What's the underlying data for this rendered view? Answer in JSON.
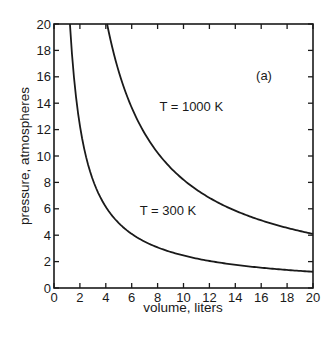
{
  "chart_data": {
    "type": "line",
    "title": "",
    "panel_label": "(a)",
    "xlabel": "volume, liters",
    "ylabel": "pressure, atmospheres",
    "xlim": [
      0,
      20
    ],
    "ylim": [
      0,
      20
    ],
    "xticks": [
      0,
      2,
      4,
      6,
      8,
      10,
      12,
      14,
      16,
      18,
      20
    ],
    "yticks": [
      0,
      2,
      4,
      6,
      8,
      10,
      12,
      14,
      16,
      18,
      20
    ],
    "grid": false,
    "legend": null,
    "series": [
      {
        "name": "T = 300 K",
        "label_pos": [
          8.8,
          5.5
        ],
        "x": [
          1.23,
          1.5,
          2,
          2.5,
          3,
          4,
          5,
          6,
          7,
          8,
          10,
          12,
          14,
          16,
          18,
          20
        ],
        "y": [
          20,
          16.4,
          12.3,
          9.85,
          8.2,
          6.15,
          4.9,
          4.1,
          3.5,
          3.1,
          2.5,
          2.05,
          1.75,
          1.55,
          1.35,
          1.25
        ]
      },
      {
        "name": "T = 1000 K",
        "label_pos": [
          10.6,
          13.4
        ],
        "x": [
          4.1,
          5,
          6,
          7,
          8,
          9,
          10,
          12,
          14,
          16,
          18,
          20
        ],
        "y": [
          20,
          16.4,
          13.7,
          11.7,
          10.3,
          9.1,
          8.2,
          6.85,
          5.85,
          5.1,
          4.55,
          4.1
        ]
      }
    ]
  }
}
